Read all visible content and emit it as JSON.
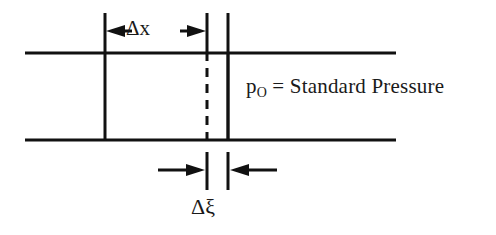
{
  "figure": {
    "name": "channel-control-volume-diagram",
    "background_color": "#ffffff",
    "line_color": "#111111",
    "width": 496,
    "height": 235
  },
  "labels": {
    "pressure": {
      "symbol": "p",
      "subscript": "O",
      "equation": " = Standard Pressure",
      "full_text": "pO = Standard Pressure"
    },
    "delta_x": "Δx",
    "delta_xi": "Δξ"
  },
  "geometry": {
    "channel_top_y": 53,
    "channel_bottom_y": 140,
    "channel_left_x": 25,
    "channel_right_x": 396,
    "left_wall_x": 105,
    "dashed_line_x": 207,
    "right_wall_x": 228,
    "top_dim_y": 31,
    "bottom_dim_y": 170
  },
  "elements": {
    "channel_top_line": "channel-top-line",
    "channel_bottom_line": "channel-bottom-line",
    "left_vertical_wall": "left-vertical-wall",
    "dashed_vertical_line": "dashed-vertical-line",
    "right_vertical_wall": "right-vertical-wall",
    "delta_x_dimension": "delta-x-dimension",
    "delta_xi_dimension": "delta-xi-dimension"
  }
}
